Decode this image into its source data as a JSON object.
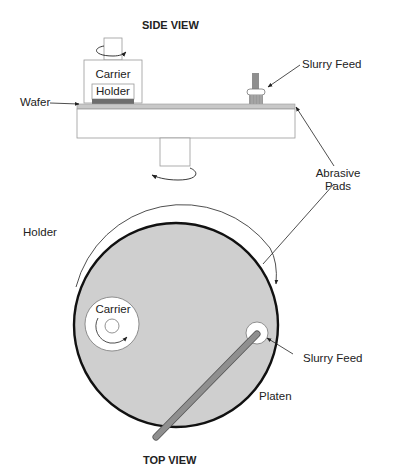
{
  "diagram": {
    "side_view": {
      "title": "SIDE VIEW",
      "labels": {
        "carrier": "Carrier",
        "holder": "Holder",
        "wafer": "Wafer",
        "slurry_feed": "Slurry Feed"
      }
    },
    "shared_labels": {
      "abrasive_pads_line1": "Abrasive",
      "abrasive_pads_line2": "Pads"
    },
    "top_view": {
      "title": "TOP VIEW",
      "labels": {
        "holder": "Holder",
        "carrier": "Carrier",
        "slurry_feed": "Slurry Feed",
        "platen": "Platen"
      }
    },
    "colors": {
      "platen_fill": "#cfcfcf",
      "pad_layer": "#c8c8c8",
      "wafer": "#6e6e6e",
      "slurry_arm": "#8f8f8f",
      "outline": "#222222",
      "thin_line": "#9a9a9a"
    }
  }
}
